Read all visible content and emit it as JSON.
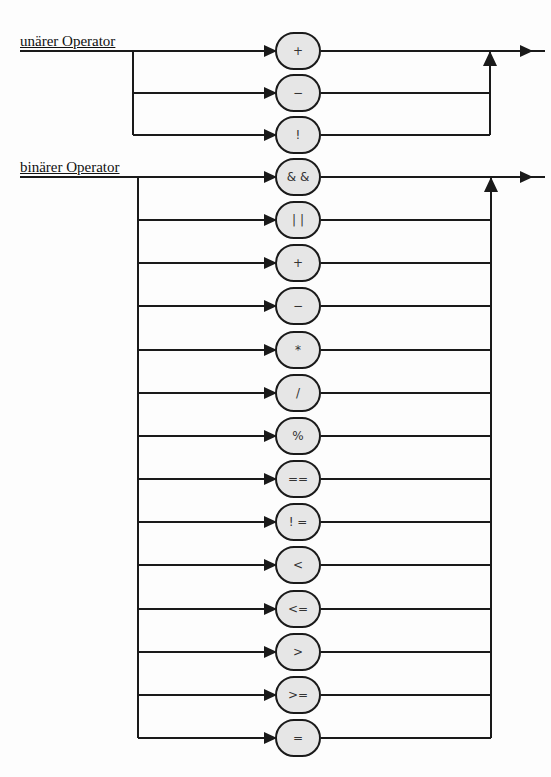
{
  "unary": {
    "label": "unärer Operator",
    "operators": [
      "+",
      "−",
      "!"
    ]
  },
  "binary": {
    "label": "binärer Operator",
    "operators": [
      "& &",
      "| |",
      "+",
      "−",
      "*",
      "/",
      "%",
      "==",
      "! =",
      "<",
      "<=",
      ">",
      ">=",
      "="
    ]
  },
  "colors": {
    "line": "#1a1a1a",
    "node_fill": "#e6e6e6",
    "background": "#fdfdfd"
  }
}
